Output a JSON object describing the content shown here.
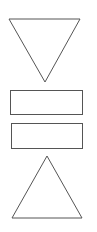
{
  "diagram": {
    "background": "#ffffff",
    "stroke_color": "#555555",
    "shapes": [
      {
        "kind": "triangle-down",
        "label": ""
      },
      {
        "kind": "rectangle",
        "label": ""
      },
      {
        "kind": "rectangle",
        "label": ""
      },
      {
        "kind": "triangle-up",
        "label": ""
      }
    ]
  }
}
